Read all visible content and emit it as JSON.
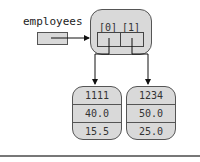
{
  "variable": {
    "name": "employees"
  },
  "array": {
    "indices": [
      "[0]",
      "[1]"
    ]
  },
  "objects": [
    {
      "fields": [
        "1111",
        "40.0",
        "15.5"
      ]
    },
    {
      "fields": [
        "1234",
        "50.0",
        "25.0"
      ]
    }
  ],
  "colors": {
    "fill": "#d9d9d9",
    "stroke": "#555555",
    "text": "#333333"
  }
}
